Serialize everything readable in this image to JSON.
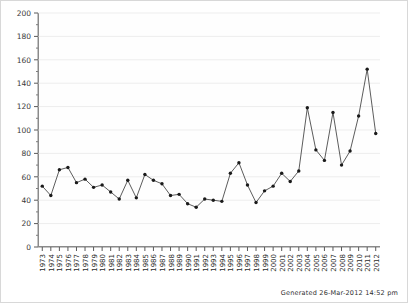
{
  "footer": {
    "generated_text": "Generated 26-Mar-2012 14:52 pm"
  },
  "chart_data": {
    "type": "line",
    "title": "",
    "subtitle": "",
    "xlabel": "",
    "ylabel": "",
    "ylim": [
      0,
      200
    ],
    "ytick_step": 20,
    "grid": true,
    "legend": "none",
    "marker": "filled-circle",
    "line_color": "#4a4a4a",
    "marker_color": "#1a1a1a",
    "background_color": "#ffffff",
    "plot_background_color": "#fefefe",
    "gridline_color": "#ededed",
    "axis_color": "#8a8a8a",
    "yticks": [
      0,
      20,
      40,
      60,
      80,
      100,
      120,
      140,
      160,
      180,
      200
    ],
    "ytick_labels": [
      "0",
      "20",
      "40",
      "60",
      "80",
      "100",
      "120",
      "140",
      "160",
      "180",
      "200"
    ],
    "categories": [
      "1973",
      "1974",
      "1975",
      "1976",
      "1977",
      "1978",
      "1979",
      "1980",
      "1981",
      "1982",
      "1983",
      "1984",
      "1985",
      "1986",
      "1987",
      "1988",
      "1989",
      "1990",
      "1991",
      "1992",
      "1993",
      "1994",
      "1995",
      "1996",
      "1997",
      "1998",
      "1999",
      "2000",
      "2001",
      "2002",
      "2003",
      "2004",
      "2005",
      "2006",
      "2007",
      "2008",
      "2009",
      "2010",
      "2011",
      "2012"
    ],
    "values": [
      52,
      44,
      66,
      68,
      55,
      58,
      51,
      53,
      47,
      41,
      57,
      42,
      62,
      57,
      54,
      44,
      45,
      37,
      34,
      41,
      40,
      39,
      63,
      72,
      53,
      38,
      48,
      52,
      63,
      56,
      65,
      119,
      83,
      74,
      115,
      70,
      82,
      112,
      152,
      97
    ]
  }
}
